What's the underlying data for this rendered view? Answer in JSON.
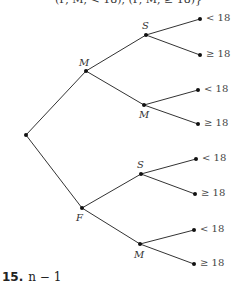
{
  "header_fragment": "(F, M, < 18), (F, M, ≥ 18)}",
  "tree": {
    "root": {
      "x": 26,
      "y": 135
    },
    "nodes": [
      {
        "id": "M1",
        "label": "M",
        "x": 86,
        "y": 71,
        "lx": 79,
        "ly": 57
      },
      {
        "id": "S1",
        "label": "S",
        "x": 146,
        "y": 35,
        "lx": 142,
        "ly": 20
      },
      {
        "id": "M2",
        "label": "M",
        "x": 144,
        "y": 105,
        "lx": 139,
        "ly": 109
      },
      {
        "id": "F",
        "label": "F",
        "x": 82,
        "y": 208,
        "lx": 76,
        "ly": 212
      },
      {
        "id": "S2",
        "label": "S",
        "x": 141,
        "y": 174,
        "lx": 137,
        "ly": 159
      },
      {
        "id": "M3",
        "label": "M",
        "x": 140,
        "y": 244,
        "lx": 134,
        "ly": 249
      }
    ],
    "leaves": [
      {
        "parent": "S1",
        "x": 200,
        "y": 19,
        "label": "< 18"
      },
      {
        "parent": "S1",
        "x": 200,
        "y": 55,
        "label": "≥ 18"
      },
      {
        "parent": "M2",
        "x": 198,
        "y": 90,
        "label": "< 18"
      },
      {
        "parent": "M2",
        "x": 198,
        "y": 124,
        "label": "≥ 18"
      },
      {
        "parent": "S2",
        "x": 196,
        "y": 159,
        "label": "< 18"
      },
      {
        "parent": "S2",
        "x": 195,
        "y": 194,
        "label": "≥ 18"
      },
      {
        "parent": "M3",
        "x": 194,
        "y": 230,
        "label": "< 18"
      },
      {
        "parent": "M3",
        "x": 194,
        "y": 264,
        "label": "≥ 18"
      }
    ]
  },
  "answer": {
    "number": "15.",
    "expression": "n − 1"
  }
}
